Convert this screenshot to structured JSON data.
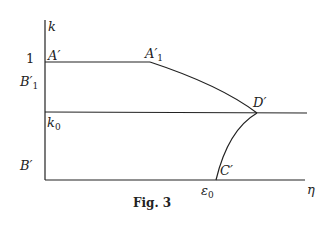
{
  "figure": {
    "caption": "Fig. 3",
    "axes": {
      "y_label": "k",
      "x_label": "η"
    },
    "y_ticks": {
      "one": "1",
      "b1_prime": "B′",
      "b1_sub": "1",
      "k0": "k",
      "k0_sub": "0",
      "b_prime": "B′"
    },
    "x_ticks": {
      "eps0": "ε",
      "eps0_sub": "0"
    },
    "points": {
      "a_prime": "A′",
      "a1_prime": "A′",
      "a1_sub": "1",
      "d_prime": "D′",
      "c_prime": "C′"
    },
    "colors": {
      "ink": "#222222",
      "background": "#ffffff"
    }
  }
}
